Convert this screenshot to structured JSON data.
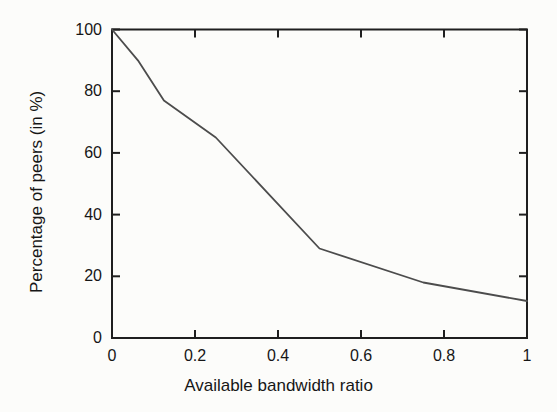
{
  "figure": {
    "background": "#fcfcfa",
    "axis_color": "#1f1f1f",
    "line_color": "#4c4c4c",
    "text_color": "#161616"
  },
  "chart_data": {
    "type": "line",
    "title": "",
    "xlabel": "Available bandwidth ratio",
    "ylabel": "Percentage of peers (in %)",
    "xlim": [
      0,
      1
    ],
    "ylim": [
      0,
      100
    ],
    "x_ticks": [
      0,
      0.2,
      0.4,
      0.6,
      0.8,
      1
    ],
    "x_tick_labels": [
      "0",
      "0.2",
      "0.4",
      "0.6",
      "0.8",
      "1"
    ],
    "y_ticks": [
      0,
      20,
      40,
      60,
      80,
      100
    ],
    "y_tick_labels": [
      "0",
      "20",
      "40",
      "60",
      "80",
      "100"
    ],
    "grid": false,
    "legend_position": "none",
    "tick_style": "inward-mirrored-box",
    "series": [
      {
        "name": "percentage-of-peers",
        "x": [
          0,
          0.0625,
          0.125,
          0.25,
          0.5,
          0.75,
          1
        ],
        "y": [
          100,
          90,
          77,
          65,
          29,
          18,
          12
        ]
      }
    ]
  }
}
